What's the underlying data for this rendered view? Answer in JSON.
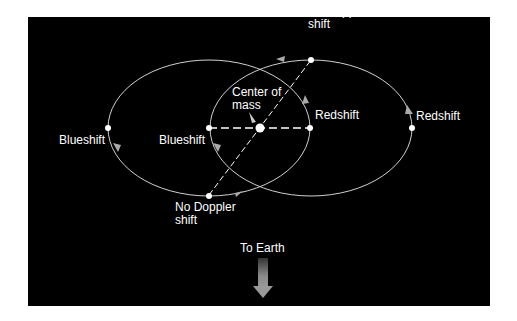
{
  "diagram": {
    "background_color": "#000000",
    "orbit_color": "#d0d0d0",
    "labels": {
      "no_doppler_top_line1": "No Doppler",
      "no_doppler_top_line2": "shift",
      "center_of_mass_line1": "Center of",
      "center_of_mass_line2": "mass",
      "blueshift_left": "Blueshift",
      "blueshift_inner": "Blueshift",
      "redshift_inner": "Redshift",
      "redshift_right": "Redshift",
      "no_doppler_bottom_line1": "No Doppler",
      "no_doppler_bottom_line2": "shift",
      "to_earth": "To Earth"
    }
  }
}
